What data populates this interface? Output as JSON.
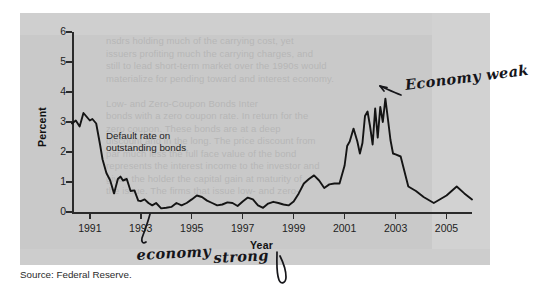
{
  "figure": {
    "source_note": "Source: Federal Reserve.",
    "series_annotation_line1": "Default rate on",
    "series_annotation_line2": "outstanding bonds",
    "bleed_through_text": "nsdrs holding much of the carrying cost, yet\nissuers profiting much the carrying charges, and\nstill to lead short-term market over the 1990s would\nmaterialize for pending toward and interest economy.\n\nLow- and Zero-Coupon Bonds Inter\nbonds with a zero coupon rate. In return for the\nzero coupon. These bonds are at a deep\ndiscount and in the long. The price discount from\npar much less the full face value of the bond\nrepresents the interest income to the investor and\ngives the holder the capital gain at maturity of\nthe issue. The firms that issue low- and zero-"
  },
  "annotations": {
    "economy_weak": "Economy weak",
    "economy_strong_word1": "economy",
    "economy_strong_word2": "strong"
  },
  "chart_data": {
    "type": "line",
    "title": "",
    "xlabel": "Year",
    "ylabel": "Percent",
    "ylim": [
      0,
      6
    ],
    "xlim": [
      1990.3,
      2006.0
    ],
    "grid": false,
    "legend": null,
    "series_label": "Default rate on outstanding bonds",
    "y_ticks": [
      0,
      1,
      2,
      3,
      4,
      5,
      6
    ],
    "x_ticks": [
      1991,
      1993,
      1995,
      1997,
      1999,
      2001,
      2003,
      2005
    ],
    "series": [
      {
        "name": "Default rate on outstanding bonds",
        "x": [
          1990.3,
          1990.45,
          1990.6,
          1990.75,
          1990.9,
          1991.0,
          1991.1,
          1991.25,
          1991.4,
          1991.5,
          1991.65,
          1991.8,
          1991.95,
          1992.1,
          1992.2,
          1992.3,
          1992.45,
          1992.6,
          1992.75,
          1992.9,
          1993.0,
          1993.15,
          1993.3,
          1993.45,
          1993.6,
          1993.8,
          1994.0,
          1994.2,
          1994.4,
          1994.6,
          1994.8,
          1995.0,
          1995.2,
          1995.4,
          1995.6,
          1995.8,
          1996.0,
          1996.2,
          1996.4,
          1996.6,
          1996.8,
          1997.0,
          1997.2,
          1997.4,
          1997.6,
          1997.8,
          1998.0,
          1998.2,
          1998.4,
          1998.6,
          1998.8,
          1999.0,
          1999.2,
          1999.4,
          1999.6,
          1999.8,
          2000.0,
          2000.2,
          2000.4,
          2000.6,
          2000.8,
          2001.0,
          2001.1,
          2001.2,
          2001.35,
          2001.5,
          2001.6,
          2001.7,
          2001.8,
          2001.9,
          2002.0,
          2002.1,
          2002.2,
          2002.3,
          2002.4,
          2002.5,
          2002.6,
          2002.7,
          2002.8,
          2002.9,
          2003.0,
          2003.2,
          2003.5,
          2003.8,
          2004.1,
          2004.5,
          2005.0,
          2005.4,
          2005.7,
          2006.0
        ],
        "y": [
          2.95,
          3.05,
          2.85,
          3.3,
          3.15,
          3.05,
          3.1,
          2.95,
          2.25,
          1.75,
          1.3,
          1.05,
          0.62,
          1.1,
          1.18,
          1.05,
          1.1,
          0.7,
          0.72,
          0.38,
          0.36,
          0.42,
          0.3,
          0.22,
          0.3,
          0.12,
          0.14,
          0.17,
          0.3,
          0.22,
          0.3,
          0.42,
          0.55,
          0.5,
          0.38,
          0.3,
          0.22,
          0.25,
          0.32,
          0.3,
          0.2,
          0.35,
          0.48,
          0.42,
          0.22,
          0.14,
          0.28,
          0.34,
          0.3,
          0.25,
          0.22,
          0.35,
          0.62,
          0.95,
          1.1,
          1.22,
          1.05,
          0.8,
          0.92,
          0.95,
          0.95,
          1.55,
          2.2,
          2.35,
          2.78,
          2.35,
          1.95,
          2.3,
          3.2,
          3.35,
          2.85,
          2.25,
          3.45,
          2.48,
          3.5,
          3.0,
          3.78,
          3.1,
          2.4,
          1.95,
          1.92,
          1.85,
          0.85,
          0.7,
          0.5,
          0.3,
          0.55,
          0.85,
          0.62,
          0.42
        ]
      }
    ]
  }
}
